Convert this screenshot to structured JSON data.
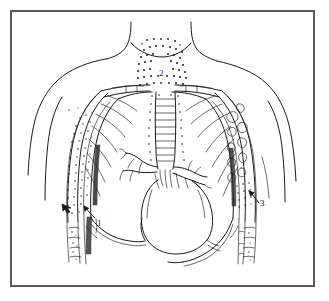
{
  "figure": {
    "border_color": "#5a5a5a",
    "ink_color": "#1a1a1a",
    "background_color": "#ffffff"
  },
  "annotations": [
    {
      "id": "1",
      "label": "1",
      "x": 100,
      "y": 222,
      "arrow_target": "left-lateral-chest-wall",
      "arrow_direction": "up-left"
    },
    {
      "id": "2",
      "label": "2",
      "x": 160,
      "y": 72,
      "arrow_target": "neck-soft-tissues",
      "arrow_direction": "none"
    },
    {
      "id": "3",
      "label": "3",
      "x": 262,
      "y": 202,
      "arrow_target": "right-lateral-chest-wall",
      "arrow_direction": "up-left"
    }
  ],
  "regions": {
    "neck": "stippled-soft-tissue",
    "left_chest_wall": "stippled-soft-tissue",
    "right_chest_wall": "bubbled-air-collection",
    "mediastinum": "trachea-and-bronchi",
    "heart": "cardiac-silhouette",
    "diaphragm": "domed-outline"
  }
}
